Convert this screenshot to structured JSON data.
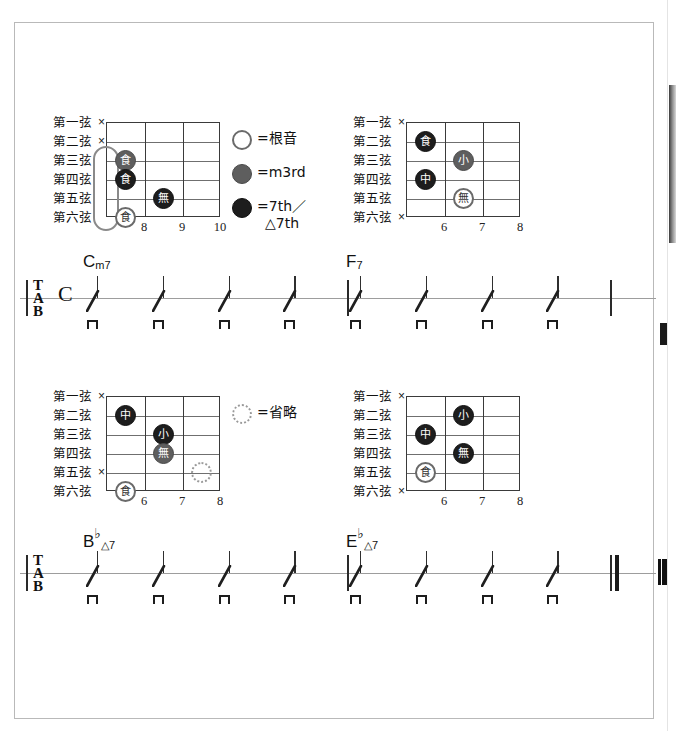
{
  "document": {
    "type": "guitar-chord-and-tab-sheet",
    "language": "ja"
  },
  "legend": {
    "items": [
      {
        "symbol": "open-circle",
        "label": "=根音",
        "label2": ""
      },
      {
        "symbol": "gray-circle",
        "label": "=m3rd",
        "label2": ""
      },
      {
        "symbol": "black-circle",
        "label": "=7th／",
        "label2": "△7th"
      }
    ],
    "omit": {
      "symbol": "dotted-circle",
      "label": "=省略"
    }
  },
  "string_labels": [
    "第一弦",
    "第二弦",
    "第三弦",
    "第四弦",
    "第五弦",
    "第六弦"
  ],
  "mute_mark": "×",
  "finger_glyphs": {
    "index": "食",
    "middle": "中",
    "ring": "無",
    "pinky": "小"
  },
  "chord_diagrams": [
    {
      "id": "cm7",
      "name": "Cm7",
      "frets": [
        "8",
        "9",
        "10"
      ],
      "muted_strings": [
        1,
        2
      ],
      "barre": {
        "from_string": 3,
        "to_string": 6,
        "fret_index": 0
      },
      "dots": [
        {
          "string": 3,
          "fret_index": 0,
          "finger": "食",
          "kind": "m3"
        },
        {
          "string": 4,
          "fret_index": 0,
          "finger": "食",
          "kind": "sev"
        },
        {
          "string": 5,
          "fret_index": 1,
          "finger": "無",
          "kind": "sev"
        },
        {
          "string": 6,
          "fret_index": 0,
          "finger": "食",
          "kind": "root"
        }
      ]
    },
    {
      "id": "f7",
      "name": "F7",
      "frets": [
        "6",
        "7",
        "8"
      ],
      "muted_strings": [
        1,
        6
      ],
      "dots": [
        {
          "string": 2,
          "fret_index": 0,
          "finger": "食",
          "kind": "sev"
        },
        {
          "string": 3,
          "fret_index": 1,
          "finger": "小",
          "kind": "m3"
        },
        {
          "string": 4,
          "fret_index": 0,
          "finger": "中",
          "kind": "sev"
        },
        {
          "string": 5,
          "fret_index": 1,
          "finger": "無",
          "kind": "root"
        }
      ]
    },
    {
      "id": "bbmaj7",
      "name": "B♭△7",
      "frets": [
        "6",
        "7",
        "8"
      ],
      "muted_strings": [
        1,
        5
      ],
      "dots": [
        {
          "string": 2,
          "fret_index": 0,
          "finger": "中",
          "kind": "sev"
        },
        {
          "string": 3,
          "fret_index": 1,
          "finger": "小",
          "kind": "sev"
        },
        {
          "string": 4,
          "fret_index": 1,
          "finger": "無",
          "kind": "m3"
        },
        {
          "string": 5,
          "fret_index": 2,
          "finger": "",
          "kind": "omit"
        },
        {
          "string": 6,
          "fret_index": 0,
          "finger": "食",
          "kind": "root"
        }
      ]
    },
    {
      "id": "ebmaj7",
      "name": "E♭△7",
      "frets": [
        "6",
        "7",
        "8"
      ],
      "muted_strings": [
        1,
        6
      ],
      "dots": [
        {
          "string": 2,
          "fret_index": 1,
          "finger": "小",
          "kind": "sev"
        },
        {
          "string": 3,
          "fret_index": 0,
          "finger": "中",
          "kind": "sev"
        },
        {
          "string": 4,
          "fret_index": 1,
          "finger": "無",
          "kind": "sev"
        },
        {
          "string": 5,
          "fret_index": 0,
          "finger": "食",
          "kind": "root"
        }
      ]
    }
  ],
  "staves": [
    {
      "id": "system-1",
      "clef": {
        "t": "T",
        "a": "A",
        "b": "B"
      },
      "time_signature": "C",
      "measures": [
        {
          "chord_root": "C",
          "chord_accidental": "",
          "chord_quality": "m7",
          "beats": 4,
          "stroke": "downstroke"
        },
        {
          "chord_root": "F",
          "chord_accidental": "",
          "chord_quality": "7",
          "beats": 4,
          "stroke": "downstroke"
        }
      ],
      "end_barline": "single"
    },
    {
      "id": "system-2",
      "clef": {
        "t": "T",
        "a": "A",
        "b": "B"
      },
      "time_signature": "",
      "measures": [
        {
          "chord_root": "B",
          "chord_accidental": "♭",
          "chord_quality": "△7",
          "beats": 4,
          "stroke": "downstroke"
        },
        {
          "chord_root": "E",
          "chord_accidental": "♭",
          "chord_quality": "△7",
          "beats": 4,
          "stroke": "downstroke"
        }
      ],
      "end_barline": "final-double"
    }
  ],
  "colors": {
    "paper": "#ffffff",
    "border": "#b9b9b9",
    "ink": "#111111",
    "staff_line": "#9d9d9d",
    "grid": "#3a3a3a",
    "m3_fill": "#5e5e5e",
    "seventh_fill": "#1d1d1d",
    "root_stroke": "#6a6a6a",
    "omit_stroke": "#9a9a9a"
  }
}
